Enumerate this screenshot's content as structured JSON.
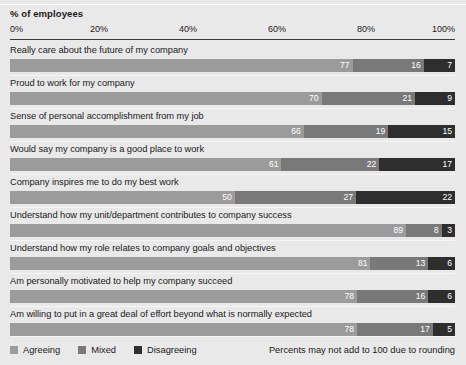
{
  "chart_data": {
    "type": "bar",
    "subtype": "stacked-horizontal-100",
    "title": "% of employees",
    "xlabel": "",
    "ylabel": "",
    "xlim": [
      0,
      100
    ],
    "grid": false,
    "legend_position": "bottom-left",
    "tick_labels": [
      "0%",
      "20%",
      "40%",
      "60%",
      "80%",
      "100%"
    ],
    "ticks": [
      0,
      20,
      40,
      60,
      80,
      100
    ],
    "categories": [
      "Really care about the future of my company",
      "Proud to work for my company",
      "Sense of personal accomplishment from my job",
      "Would say my company is a good place to work",
      "Company inspires me to do my best work",
      "Understand how my unit/department contributes to company success",
      "Understand how my role relates to company goals and objectives",
      "Am personally motivated to help my company succeed",
      "Am willing to put in a great deal of effort beyond what is normally expected"
    ],
    "series": [
      {
        "name": "Agreeing",
        "color": "#9b9b9b",
        "values": [
          77,
          70,
          66,
          61,
          50,
          89,
          81,
          78,
          78
        ]
      },
      {
        "name": "Mixed",
        "color": "#797979",
        "values": [
          16,
          21,
          19,
          22,
          27,
          8,
          13,
          16,
          17
        ]
      },
      {
        "name": "Disagreeing",
        "color": "#2e2e2e",
        "values": [
          7,
          9,
          15,
          17,
          22,
          3,
          6,
          6,
          5
        ]
      }
    ],
    "annotations": [
      "Percents may not add to 100 due to rounding"
    ]
  },
  "legend": [
    {
      "label": "Agreeing",
      "color": "#9b9b9b"
    },
    {
      "label": "Mixed",
      "color": "#797979"
    },
    {
      "label": "Disagreeing",
      "color": "#2e2e2e"
    }
  ],
  "footnote": "Percents may not add to 100 due to rounding"
}
